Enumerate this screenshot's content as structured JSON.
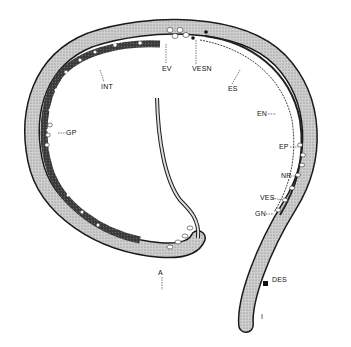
{
  "figure": {
    "labels": [
      {
        "id": "int",
        "text": "INT",
        "x": 101,
        "y": 83
      },
      {
        "id": "gp",
        "text": "GP",
        "x": 66,
        "y": 129
      },
      {
        "id": "ev",
        "text": "EV",
        "x": 162,
        "y": 65
      },
      {
        "id": "vesn",
        "text": "VESN",
        "x": 192,
        "y": 65
      },
      {
        "id": "es",
        "text": "ES",
        "x": 228,
        "y": 85
      },
      {
        "id": "en",
        "text": "EN",
        "x": 257,
        "y": 110
      },
      {
        "id": "ep",
        "text": "EP",
        "x": 279,
        "y": 143
      },
      {
        "id": "nr",
        "text": "NR",
        "x": 281,
        "y": 172
      },
      {
        "id": "ves",
        "text": "VES",
        "x": 260,
        "y": 194
      },
      {
        "id": "gn",
        "text": "GN",
        "x": 255,
        "y": 210
      },
      {
        "id": "a",
        "text": "A",
        "x": 158,
        "y": 269
      },
      {
        "id": "des",
        "text": "DES",
        "x": 272,
        "y": 276
      },
      {
        "id": "i",
        "text": "I",
        "x": 261,
        "y": 313
      }
    ]
  },
  "colors": {
    "ink": "#1a1a1a",
    "body_fill": "#d9d9d9",
    "intestine_fill": "#3a3a3a",
    "background": "#ffffff"
  }
}
